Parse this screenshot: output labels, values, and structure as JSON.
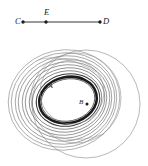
{
  "figure": {
    "background": "#ffffff",
    "ink": "#1d1d1d",
    "segment": {
      "label_c": "C",
      "label_e": "E",
      "label_d": "D",
      "c_point": [
        23,
        22
      ],
      "e_point": [
        46,
        22
      ],
      "d_point": [
        100,
        22
      ],
      "line_from": [
        23,
        22
      ],
      "line_to": [
        100,
        22
      ]
    },
    "points": {
      "label_a": "A",
      "label_b": "B",
      "a_point": [
        46,
        87
      ],
      "b_point": [
        87,
        104
      ]
    },
    "ellipses": [
      {
        "cx": 68,
        "cy": 100,
        "rx": 27,
        "ry": 21,
        "rot": -12,
        "w": 0.7,
        "shade": "#2b2b2b"
      },
      {
        "cx": 68,
        "cy": 100,
        "rx": 29,
        "ry": 23,
        "rot": -12,
        "w": 2.6,
        "shade": "#1a1a1a"
      },
      {
        "cx": 68,
        "cy": 100,
        "rx": 32,
        "ry": 26,
        "rot": -12,
        "w": 1.0,
        "shade": "#3a3a3a"
      },
      {
        "cx": 67,
        "cy": 100,
        "rx": 35,
        "ry": 29,
        "rot": -12,
        "w": 0.6,
        "shade": "#4a4a4a"
      },
      {
        "cx": 67,
        "cy": 100,
        "rx": 38,
        "ry": 32,
        "rot": -12,
        "w": 0.6,
        "shade": "#555555"
      },
      {
        "cx": 66,
        "cy": 100,
        "rx": 41,
        "ry": 35,
        "rot": -12,
        "w": 0.6,
        "shade": "#5d5d5d"
      },
      {
        "cx": 66,
        "cy": 100,
        "rx": 44,
        "ry": 38,
        "rot": -12,
        "w": 0.6,
        "shade": "#666666"
      },
      {
        "cx": 65,
        "cy": 100,
        "rx": 47,
        "ry": 41,
        "rot": -12,
        "w": 0.6,
        "shade": "#6e6e6e"
      },
      {
        "cx": 65,
        "cy": 100,
        "rx": 50,
        "ry": 44,
        "rot": -12,
        "w": 0.6,
        "shade": "#777777"
      },
      {
        "cx": 64,
        "cy": 100,
        "rx": 53,
        "ry": 47,
        "rot": -12,
        "w": 0.6,
        "shade": "#808080"
      },
      {
        "cx": 64,
        "cy": 100,
        "rx": 56,
        "ry": 50,
        "rot": -12,
        "w": 0.6,
        "shade": "#8a8a8a"
      }
    ],
    "overlay_circles": [
      {
        "cx": 86,
        "cy": 104,
        "r": 54,
        "w": 0.55,
        "shade": "#7d7d7d"
      },
      {
        "cx": 72,
        "cy": 92,
        "r": 32,
        "w": 0.55,
        "shade": "#8a8a8a"
      },
      {
        "cx": 76,
        "cy": 98,
        "r": 45,
        "w": 0.55,
        "shade": "#8a8a8a"
      }
    ],
    "thin_arcs": [
      {
        "d": "M 38 60 Q 62 52 96 72",
        "w": 0.5,
        "shade": "#909090"
      },
      {
        "d": "M 30 120 Q 60 150 104 134",
        "w": 0.5,
        "shade": "#909090"
      }
    ]
  }
}
